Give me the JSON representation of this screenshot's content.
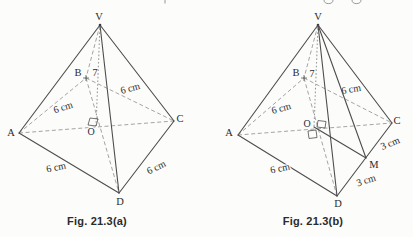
{
  "figure_a": {
    "caption": "Fig. 21.3(a)",
    "vertices": {
      "v": "V",
      "a": "A",
      "b": "B",
      "c": "C",
      "d": "D",
      "o": "O"
    },
    "measurements": {
      "vo": "7",
      "ab": "6 cm",
      "bc": "6 cm",
      "ad": "6 cm",
      "cd": "6 cm"
    }
  },
  "figure_b": {
    "caption": "Fig. 21.3(b)",
    "vertices": {
      "v": "V",
      "a": "A",
      "b": "B",
      "c": "C",
      "d": "D",
      "o": "O",
      "m": "M"
    },
    "measurements": {
      "vo": "7",
      "ab": "6 cm",
      "bc": "6 cm",
      "ad": "6 cm",
      "cm": "3 cm",
      "md": "3 cm"
    }
  },
  "colors": {
    "background": "#fcfcfb",
    "solid_line": "#4d4d4d",
    "dashed_line": "#9a9a9a",
    "text": "#2b2b2b"
  }
}
